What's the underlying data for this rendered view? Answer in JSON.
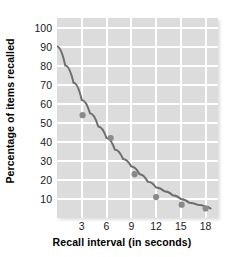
{
  "chart_data": {
    "type": "scatter",
    "title": "",
    "xlabel": "Recall interval (in seconds)",
    "ylabel": "Percentage of items recalled",
    "xlim": [
      0,
      19.5
    ],
    "ylim": [
      0,
      105
    ],
    "xticks": [
      3,
      6,
      9,
      12,
      15,
      18
    ],
    "yticks": [
      10,
      20,
      30,
      40,
      50,
      60,
      70,
      80,
      90,
      100
    ],
    "grid": true,
    "legend": "none",
    "series": [
      {
        "name": "Observed recall",
        "type": "scatter",
        "marker_color": "#8a8a8a",
        "x": [
          3.1,
          6.5,
          9.4,
          12.0,
          15.1,
          18.0
        ],
        "y": [
          54,
          42,
          23,
          11,
          7,
          5
        ]
      },
      {
        "name": "Fitted forgetting curve",
        "type": "line",
        "line_color": "#6e6e6e",
        "x": [
          0.0,
          1.0,
          2.0,
          3.0,
          4.0,
          5.0,
          6.0,
          7.0,
          8.0,
          9.0,
          10.0,
          11.0,
          12.0,
          13.0,
          14.0,
          15.0,
          16.0,
          17.0,
          18.0,
          18.6
        ],
        "y": [
          90,
          80,
          71,
          62,
          55,
          48,
          42,
          36,
          31,
          27,
          23,
          19,
          16,
          14,
          12,
          10,
          8,
          7,
          6,
          5
        ]
      }
    ],
    "colors": {
      "plot_background": "#dcdcdc",
      "gridline": "#ffffff",
      "curve": "#6e6e6e",
      "point": "#8a8a8a",
      "text": "#000000",
      "page_background": "#ffffff"
    }
  },
  "axes": {
    "y_title": "Percentage of items recalled",
    "x_title": "Recall interval (in seconds)",
    "y_tick_labels": [
      "100",
      "90",
      "80",
      "70",
      "60",
      "50",
      "40",
      "30",
      "20",
      "10"
    ],
    "x_tick_labels": [
      "3",
      "6",
      "9",
      "12",
      "15",
      "18"
    ]
  }
}
